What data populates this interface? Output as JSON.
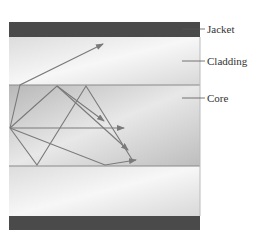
{
  "diagram": {
    "layers": [
      {
        "name": "Jacket",
        "color": "#4a4a4a"
      },
      {
        "name": "Cladding",
        "color": "#e6e6e6"
      },
      {
        "name": "Core",
        "color": "#c4c4c4"
      },
      {
        "name": "Cladding",
        "color": "#e6e6e6"
      },
      {
        "name": "Jacket",
        "color": "#4a4a4a"
      }
    ],
    "labels": {
      "jacket": "Jacket",
      "cladding": "Cladding",
      "core": "Core"
    },
    "ray_color": "#7a7a7a",
    "rays": [
      {
        "description": "Ray refracting out of core into cladding"
      },
      {
        "description": "Ray reflecting at top core boundary, ending downward"
      },
      {
        "description": "Axial ray along center"
      },
      {
        "description": "Steep ray reflecting off bottom and top boundaries"
      },
      {
        "description": "Shallow ray reflecting off bottom boundary"
      }
    ]
  }
}
